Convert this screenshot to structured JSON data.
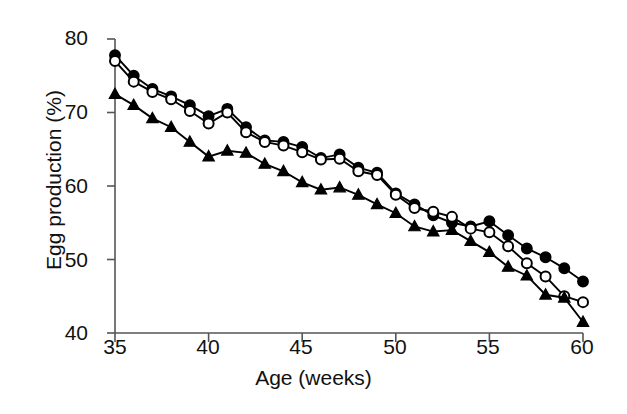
{
  "chart_data": {
    "type": "line",
    "title": "",
    "xlabel": "Age (weeks)",
    "ylabel": "Egg production (%)",
    "xlim": [
      35,
      60
    ],
    "ylim": [
      40,
      80
    ],
    "xticks": [
      35,
      40,
      45,
      50,
      55,
      60
    ],
    "yticks": [
      40,
      50,
      60,
      70,
      80
    ],
    "grid": false,
    "legend": "none",
    "x": [
      35,
      36,
      37,
      38,
      39,
      40,
      41,
      42,
      43,
      44,
      45,
      46,
      47,
      48,
      49,
      50,
      51,
      52,
      53,
      54,
      55,
      56,
      57,
      58,
      59,
      60
    ],
    "series": [
      {
        "name": "filled-circle-series",
        "marker": "filled-circle",
        "values": [
          77.8,
          75.0,
          73.2,
          72.2,
          71.0,
          69.5,
          70.5,
          68.0,
          66.2,
          66.0,
          65.3,
          63.8,
          64.3,
          62.5,
          61.8,
          59.0,
          57.5,
          56.0,
          55.0,
          54.5,
          55.2,
          53.3,
          51.5,
          50.3,
          48.8,
          47.0
        ]
      },
      {
        "name": "open-circle-series",
        "marker": "open-circle",
        "values": [
          77.0,
          74.2,
          72.8,
          71.8,
          70.2,
          68.5,
          70.0,
          67.3,
          66.0,
          65.5,
          64.6,
          63.6,
          63.7,
          62.0,
          61.5,
          58.8,
          57.0,
          56.5,
          55.8,
          54.2,
          53.7,
          51.8,
          49.5,
          47.7,
          45.0,
          44.2
        ]
      },
      {
        "name": "filled-triangle-series",
        "marker": "filled-triangle",
        "values": [
          72.5,
          71.0,
          69.2,
          68.0,
          66.0,
          64.0,
          64.8,
          64.5,
          63.0,
          62.0,
          60.5,
          59.5,
          59.8,
          58.8,
          57.5,
          56.3,
          54.5,
          53.8,
          54.0,
          52.5,
          51.0,
          49.0,
          47.8,
          45.2,
          44.8,
          41.5
        ]
      }
    ],
    "colors": {
      "line": "#000000",
      "marker_fill": "#000000",
      "marker_open_fill": "#ffffff",
      "axis": "#555555",
      "background": "#ffffff"
    }
  },
  "axes": {
    "y_label": "Egg production (%)",
    "x_label": "Age (weeks)",
    "y_ticks": [
      "80",
      "70",
      "60",
      "50",
      "40"
    ],
    "x_ticks": [
      "35",
      "40",
      "45",
      "50",
      "55",
      "60"
    ]
  }
}
